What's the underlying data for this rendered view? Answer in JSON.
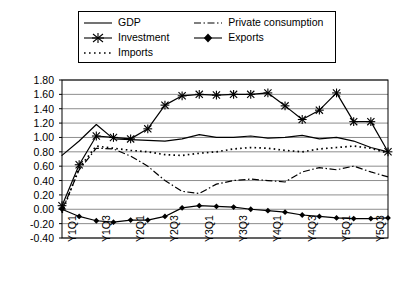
{
  "chart_data": {
    "type": "line",
    "title": "",
    "xlabel": "",
    "ylabel": "",
    "ylim": [
      -0.4,
      1.8
    ],
    "ytick_step": 0.2,
    "grid": true,
    "legend_position": "top",
    "x": [
      "Y1Q1",
      "Y1Q2",
      "Y1Q3",
      "Y1Q4",
      "Y2Q1",
      "Y2Q2",
      "Y2Q3",
      "Y2Q4",
      "Y3Q1",
      "Y3Q2",
      "Y3Q3",
      "Y3Q4",
      "Y4Q1",
      "Y4Q2",
      "Y4Q3",
      "Y4Q4",
      "Y5Q1",
      "Y5Q2",
      "Y5Q3",
      "Y5Q4"
    ],
    "xtick_labels": [
      "Y1Q1",
      "Y1Q3",
      "Y2Q1",
      "Y2Q3",
      "Y3Q1",
      "Y3Q3",
      "Y4Q1",
      "Y4Q3",
      "Y5Q1",
      "Y5Q3"
    ],
    "ytick_labels": [
      "1.80",
      "1.60",
      "1.40",
      "1.20",
      "1.00",
      "0.80",
      "0.60",
      "0.40",
      "0.20",
      "0.00",
      "-0.20",
      "-0.40"
    ],
    "series": [
      {
        "name": "GDP",
        "style": "solid",
        "marker": "none",
        "values": [
          0.75,
          0.95,
          1.18,
          0.98,
          0.97,
          0.96,
          0.95,
          0.98,
          1.04,
          1.0,
          1.0,
          1.02,
          0.99,
          1.0,
          1.03,
          0.98,
          1.0,
          0.95,
          0.86,
          0.8
        ]
      },
      {
        "name": "Investment",
        "style": "solid",
        "marker": "star",
        "values": [
          0.05,
          0.62,
          1.02,
          1.0,
          0.98,
          1.12,
          1.45,
          1.58,
          1.6,
          1.59,
          1.6,
          1.6,
          1.62,
          1.44,
          1.25,
          1.38,
          1.62,
          1.22,
          1.22,
          0.8
        ]
      },
      {
        "name": "Imports",
        "style": "dotted",
        "marker": "none",
        "values": [
          -0.05,
          0.58,
          0.88,
          0.85,
          0.82,
          0.8,
          0.76,
          0.75,
          0.78,
          0.8,
          0.84,
          0.86,
          0.85,
          0.82,
          0.8,
          0.84,
          0.86,
          0.88,
          0.85,
          0.78
        ]
      },
      {
        "name": "Private consumption",
        "style": "dashdot",
        "marker": "none",
        "values": [
          -0.02,
          0.55,
          0.85,
          0.84,
          0.74,
          0.6,
          0.4,
          0.25,
          0.22,
          0.35,
          0.4,
          0.42,
          0.4,
          0.38,
          0.52,
          0.58,
          0.55,
          0.6,
          0.52,
          0.45
        ]
      },
      {
        "name": "Exports",
        "style": "solid",
        "marker": "diamond",
        "values": [
          0.0,
          -0.1,
          -0.16,
          -0.18,
          -0.15,
          -0.15,
          -0.1,
          0.02,
          0.05,
          0.04,
          0.03,
          0.0,
          -0.02,
          -0.04,
          -0.08,
          -0.1,
          -0.12,
          -0.13,
          -0.13,
          -0.12
        ]
      }
    ]
  },
  "legend": {
    "entries": [
      {
        "label": "GDP",
        "icon": "solid-line-swatch"
      },
      {
        "label": "Private consumption",
        "icon": "dashdot-line-swatch"
      },
      {
        "label": "Investment",
        "icon": "star-marker-line-swatch"
      },
      {
        "label": "Exports",
        "icon": "diamond-marker-line-swatch"
      },
      {
        "label": "Imports",
        "icon": "dotted-line-swatch"
      }
    ]
  },
  "colors": {
    "line": "#000000",
    "grid": "#808080",
    "axis": "#000000",
    "background": "#ffffff"
  }
}
